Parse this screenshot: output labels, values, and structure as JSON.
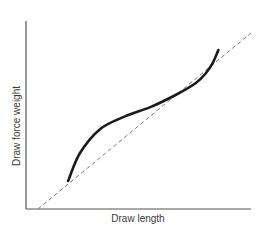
{
  "chart_data": {
    "type": "line",
    "title": "",
    "xlabel": "Draw length",
    "ylabel": "Draw force weight",
    "grid": false,
    "legend": null,
    "xticks": [],
    "yticks": [],
    "xlim": [
      0,
      100
    ],
    "ylim": [
      0,
      100
    ],
    "series": [
      {
        "name": "Draw force curve",
        "style": "solid",
        "color": "#1a1a1a",
        "x": [
          18.7,
          24.0,
          33.0,
          44.0,
          55.5,
          66.5,
          75.5,
          80.0,
          83.0,
          85.5
        ],
        "y": [
          15.9,
          31.8,
          45.5,
          52.6,
          58.0,
          64.8,
          71.6,
          77.3,
          83.0,
          90.3
        ]
      },
      {
        "name": "Linear reference",
        "style": "dashed",
        "color": "#7a7a7a",
        "x": [
          5.3,
          100
        ],
        "y": [
          0,
          100
        ]
      }
    ]
  },
  "colors": {
    "axis": "#555555",
    "curve": "#1a1a1a",
    "reference": "#7a7a7a",
    "label": "#3a3a3a"
  }
}
